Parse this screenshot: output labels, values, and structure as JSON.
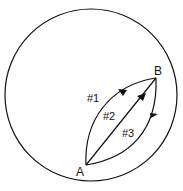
{
  "diagram": {
    "type": "paths-in-circle",
    "points": [
      {
        "id": "A",
        "label": "A"
      },
      {
        "id": "B",
        "label": "B"
      }
    ],
    "paths": [
      {
        "label": "#1",
        "from": "A",
        "to": "B",
        "shape": "curved-left"
      },
      {
        "label": "#2",
        "from": "A",
        "to": "B",
        "shape": "straight"
      },
      {
        "label": "#3",
        "from": "A",
        "to": "B",
        "shape": "curved-right"
      }
    ],
    "colors": {
      "stroke": "#111111",
      "background": "#ffffff"
    }
  }
}
